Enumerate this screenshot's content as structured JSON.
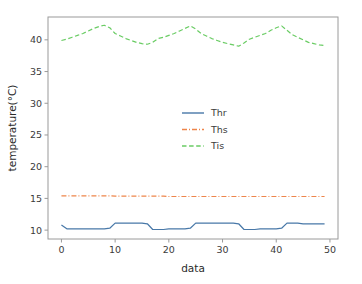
{
  "figure": {
    "background_color": "#ffffff",
    "plot_background_color": "#ffffff",
    "spine_color": "#9a9a9a"
  },
  "axes": {
    "xlabel": "data",
    "ylabel": "temperature(°C)",
    "x_ticks": [
      "0",
      "10",
      "20",
      "30",
      "40",
      "50"
    ],
    "y_ticks": [
      "10",
      "15",
      "20",
      "25",
      "30",
      "35",
      "40"
    ]
  },
  "legend": {
    "position": "center",
    "entries": [
      {
        "label": "Thr",
        "color": "#4878a8",
        "style": "solid"
      },
      {
        "label": "Ths",
        "color": "#ee854a",
        "style": "dashdot"
      },
      {
        "label": "Tis",
        "color": "#6acc64",
        "style": "dashed"
      }
    ]
  },
  "chart_data": {
    "type": "line",
    "title": "",
    "xlabel": "data",
    "ylabel": "temperature(°C)",
    "xlim": [
      -2.5,
      51.5
    ],
    "ylim": [
      8.6,
      43.6
    ],
    "xticks": [
      0,
      10,
      20,
      30,
      40,
      50
    ],
    "yticks": [
      10,
      15,
      20,
      25,
      30,
      35,
      40
    ],
    "grid": false,
    "legend_position": "center",
    "x": [
      0,
      1,
      2,
      3,
      4,
      5,
      6,
      7,
      8,
      9,
      10,
      11,
      12,
      13,
      14,
      15,
      16,
      17,
      18,
      19,
      20,
      21,
      22,
      23,
      24,
      25,
      26,
      27,
      28,
      29,
      30,
      31,
      32,
      33,
      34,
      35,
      36,
      37,
      38,
      39,
      40,
      41,
      42,
      43,
      44,
      45,
      46,
      47,
      48,
      49
    ],
    "series": [
      {
        "name": "Thr",
        "color": "#4878a8",
        "linestyle": "solid",
        "linewidth": 1.2,
        "values": [
          10.8,
          10.2,
          10.2,
          10.2,
          10.2,
          10.2,
          10.2,
          10.2,
          10.2,
          10.3,
          11.1,
          11.1,
          11.1,
          11.1,
          11.1,
          11.1,
          11.0,
          10.1,
          10.1,
          10.1,
          10.2,
          10.2,
          10.2,
          10.2,
          10.3,
          11.1,
          11.1,
          11.1,
          11.1,
          11.1,
          11.1,
          11.1,
          11.1,
          11.0,
          10.1,
          10.1,
          10.1,
          10.2,
          10.2,
          10.2,
          10.2,
          10.3,
          11.1,
          11.1,
          11.1,
          11.0,
          11.0,
          11.0,
          11.0,
          11.0
        ]
      },
      {
        "name": "Ths",
        "color": "#ee854a",
        "linestyle": "dashdot",
        "linewidth": 1.2,
        "values": [
          15.4,
          15.4,
          15.4,
          15.4,
          15.4,
          15.4,
          15.4,
          15.4,
          15.4,
          15.4,
          15.35,
          15.35,
          15.35,
          15.35,
          15.35,
          15.35,
          15.35,
          15.35,
          15.35,
          15.35,
          15.3,
          15.3,
          15.3,
          15.3,
          15.3,
          15.3,
          15.3,
          15.3,
          15.3,
          15.3,
          15.3,
          15.3,
          15.3,
          15.3,
          15.3,
          15.3,
          15.3,
          15.3,
          15.3,
          15.3,
          15.3,
          15.3,
          15.3,
          15.3,
          15.3,
          15.3,
          15.3,
          15.3,
          15.3,
          15.3
        ]
      },
      {
        "name": "Tis",
        "color": "#6acc64",
        "linestyle": "dashed",
        "linewidth": 1.2,
        "values": [
          39.9,
          40.1,
          40.4,
          40.7,
          41.0,
          41.4,
          41.8,
          42.1,
          42.3,
          41.9,
          41.0,
          40.6,
          40.2,
          39.9,
          39.6,
          39.4,
          39.3,
          39.6,
          40.2,
          40.4,
          40.7,
          41.0,
          41.4,
          41.8,
          42.2,
          41.7,
          41.0,
          40.6,
          40.2,
          39.9,
          39.6,
          39.4,
          39.2,
          39.0,
          39.5,
          40.1,
          40.4,
          40.7,
          41.0,
          41.5,
          41.9,
          42.2,
          41.5,
          40.8,
          40.4,
          40.0,
          39.6,
          39.4,
          39.2,
          39.1
        ]
      }
    ]
  }
}
